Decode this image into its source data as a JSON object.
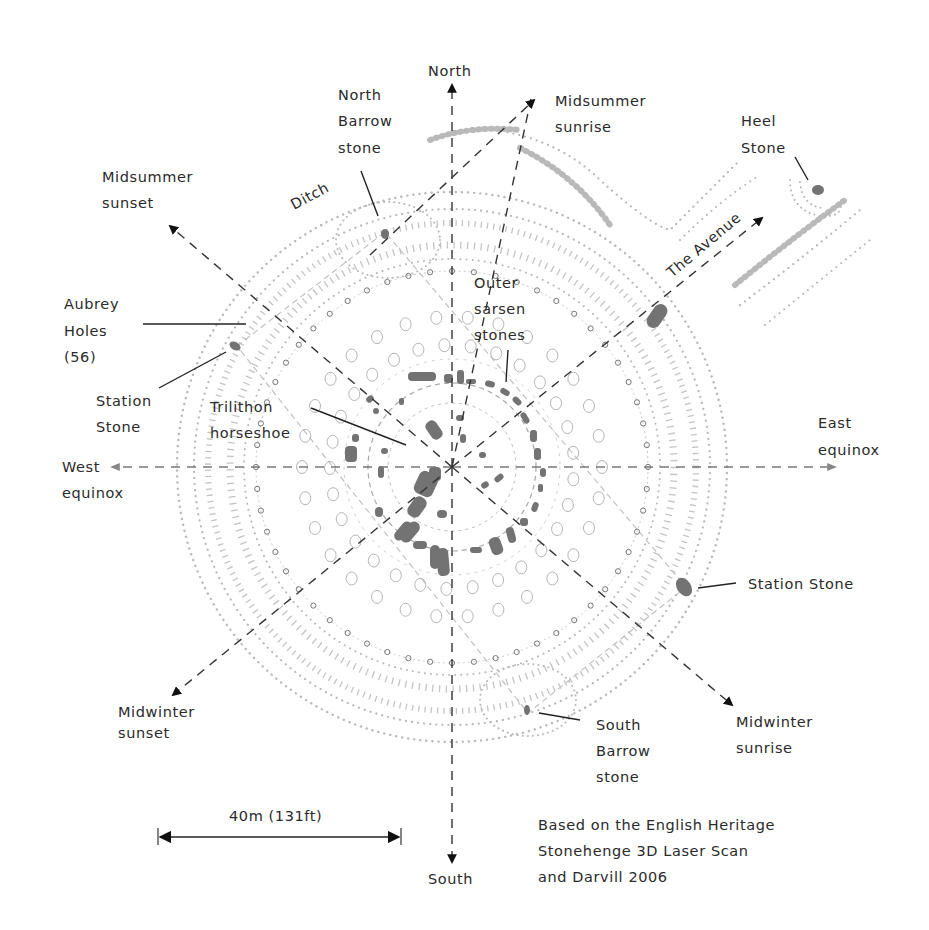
{
  "diagram": {
    "compass": {
      "north": "North",
      "south": "South",
      "east_line1": "East",
      "east_line2": "equinox",
      "west_line1": "West",
      "west_line2": "equinox"
    },
    "alignments": {
      "midsummer_sunrise": [
        "Midsummer",
        "sunrise"
      ],
      "midsummer_sunset": [
        "Midsummer",
        "sunset"
      ],
      "midwinter_sunrise": [
        "Midwinter",
        "sunrise"
      ],
      "midwinter_sunset": [
        "Midwinter",
        "sunset"
      ],
      "avenue": "The Avenue"
    },
    "features": {
      "north_barrow_stone": [
        "North",
        "Barrow",
        "stone"
      ],
      "heel_stone": [
        "Heel",
        "Stone"
      ],
      "ditch": "Ditch",
      "aubrey_holes": [
        "Aubrey",
        "Holes",
        "(56)"
      ],
      "station_stone_west": [
        "Station",
        "Stone"
      ],
      "trilithon_horseshoe": [
        "Trilithon",
        "horseshoe"
      ],
      "outer_sarsen_stones": [
        "Outer",
        "sarsen",
        "stones"
      ],
      "station_stone_east": "Station Stone",
      "south_barrow_stone": [
        "South",
        "Barrow",
        "stone"
      ]
    },
    "scale_bar": {
      "label": "40m (131ft)"
    },
    "credit": [
      "Based on the English Heritage",
      "Stonehenge 3D Laser Scan",
      "and Darvill 2006"
    ],
    "colors": {
      "stone": "#737373",
      "earthwork": "#bdbdbd",
      "axis": "#333333",
      "text": "#2a2a2a"
    }
  }
}
